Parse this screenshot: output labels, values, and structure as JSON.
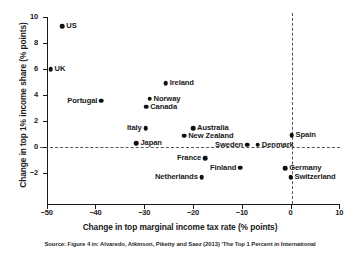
{
  "chart_data": {
    "type": "scatter",
    "title": "",
    "xlabel": "Change in top marginal income tax rate (% points)",
    "ylabel": "Change in top 1% income share (% points)",
    "xlim": [
      -50,
      10
    ],
    "ylim": [
      -2,
      10
    ],
    "xticks": [
      -50,
      -40,
      -30,
      -20,
      -10,
      0,
      10
    ],
    "xtick_labels": [
      "−50",
      "−40",
      "−30",
      "−20",
      "−10",
      "0",
      "10"
    ],
    "yticks": [
      -2,
      0,
      2,
      4,
      6,
      8,
      10
    ],
    "ytick_labels": [
      "−2",
      "0",
      "2",
      "4",
      "6",
      "8",
      "10"
    ],
    "grid": false,
    "legend": null,
    "reference_lines": [
      {
        "axis": "horizontal",
        "value": 0,
        "style": "dashed"
      },
      {
        "axis": "vertical",
        "value": 0,
        "style": "dashed"
      }
    ],
    "points": [
      {
        "label": "US",
        "x": -46.8,
        "y": 9.3,
        "label_pos": "right"
      },
      {
        "label": "UK",
        "x": -49.2,
        "y": 6.0,
        "label_pos": "right"
      },
      {
        "label": "Portugal",
        "x": -38.8,
        "y": 3.55,
        "label_pos": "left"
      },
      {
        "label": "Ireland",
        "x": -25.6,
        "y": 4.9,
        "label_pos": "right"
      },
      {
        "label": "Norway",
        "x": -28.9,
        "y": 3.7,
        "label_pos": "right"
      },
      {
        "label": "Canada",
        "x": -29.6,
        "y": 3.1,
        "label_pos": "right"
      },
      {
        "label": "Italy",
        "x": -29.7,
        "y": 1.45,
        "label_pos": "left"
      },
      {
        "label": "Australia",
        "x": -20.0,
        "y": 1.45,
        "label_pos": "right"
      },
      {
        "label": "New Zealand",
        "x": -21.8,
        "y": 0.85,
        "label_pos": "right"
      },
      {
        "label": "Japan",
        "x": -31.6,
        "y": 0.3,
        "label_pos": "right"
      },
      {
        "label": "Sweden",
        "x": -8.9,
        "y": 0.15,
        "label_pos": "left"
      },
      {
        "label": "Denmark",
        "x": -6.7,
        "y": 0.15,
        "label_pos": "right"
      },
      {
        "label": "Spain",
        "x": 0.2,
        "y": 0.9,
        "label_pos": "right"
      },
      {
        "label": "France",
        "x": -17.5,
        "y": -0.9,
        "label_pos": "left"
      },
      {
        "label": "Finland",
        "x": -10.3,
        "y": -1.6,
        "label_pos": "left"
      },
      {
        "label": "Germany",
        "x": -1.1,
        "y": -1.65,
        "label_pos": "right"
      },
      {
        "label": "Netherlands",
        "x": -18.2,
        "y": -2.35,
        "label_pos": "left"
      },
      {
        "label": "Switzerland",
        "x": 0.0,
        "y": -2.35,
        "label_pos": "right"
      }
    ]
  },
  "source_note": "Source: Figure 4 in: Alvaredo, Atkinson, Piketty and Saez (2013) 'The Top 1 Percent in International",
  "colors": {
    "marker": "#111111",
    "axis": "#1a1a1a",
    "reference_line": "#555555",
    "background": "#ffffff"
  }
}
